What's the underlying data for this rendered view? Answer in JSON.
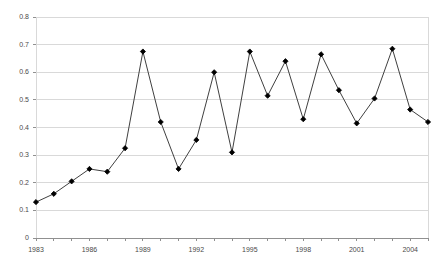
{
  "chart_data": {
    "type": "line",
    "title": "",
    "subtitle": "",
    "xlabel": "",
    "ylabel": "",
    "xlim": [
      1983,
      2005
    ],
    "ylim": [
      0,
      0.8
    ],
    "grid": true,
    "legend": false,
    "marker": "filled-diamond",
    "line_color": "#404040",
    "marker_color": "#000000",
    "grid_color": "#d9d9d9",
    "yticks": [
      "0",
      "0.1",
      "0.2",
      "0.3",
      "0.4",
      "0.5",
      "0.6",
      "0.7",
      "0.8"
    ],
    "ytick_values": [
      0,
      0.1,
      0.2,
      0.3,
      0.4,
      0.5,
      0.6,
      0.7,
      0.8
    ],
    "xticks": [
      "1983",
      "1986",
      "1989",
      "1992",
      "1995",
      "1998",
      "2001",
      "2004"
    ],
    "xtick_values": [
      1983,
      1986,
      1989,
      1992,
      1995,
      1998,
      2001,
      2004
    ],
    "x": [
      1983,
      1984,
      1985,
      1986,
      1987,
      1988,
      1989,
      1990,
      1991,
      1992,
      1993,
      1994,
      1995,
      1996,
      1997,
      1998,
      1999,
      2000,
      2001,
      2002,
      2003,
      2004,
      2005
    ],
    "categories": [
      1983,
      1984,
      1985,
      1986,
      1987,
      1988,
      1989,
      1990,
      1991,
      1992,
      1993,
      1994,
      1995,
      1996,
      1997,
      1998,
      1999,
      2000,
      2001,
      2002,
      2003,
      2004,
      2005
    ],
    "values": [
      0.13,
      0.16,
      0.205,
      0.25,
      0.24,
      0.325,
      0.675,
      0.42,
      0.25,
      0.355,
      0.6,
      0.31,
      0.675,
      0.515,
      0.64,
      0.43,
      0.665,
      0.535,
      0.415,
      0.505,
      0.685,
      0.465,
      0.42
    ],
    "series": [
      {
        "name": "series-1",
        "values": [
          0.13,
          0.16,
          0.205,
          0.25,
          0.24,
          0.325,
          0.675,
          0.42,
          0.25,
          0.355,
          0.6,
          0.31,
          0.675,
          0.515,
          0.64,
          0.43,
          0.665,
          0.535,
          0.415,
          0.505,
          0.685,
          0.465,
          0.42
        ]
      }
    ]
  }
}
